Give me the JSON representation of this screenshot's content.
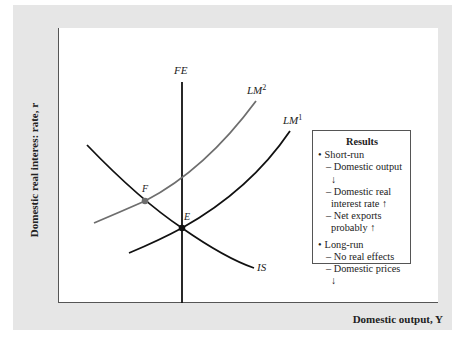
{
  "axes": {
    "y_label": "Domestic real interes: rate, r",
    "x_label": "Domestic output, Y"
  },
  "curves": {
    "FE": "FE",
    "LM2": "LM",
    "LM2_sup": "2",
    "LM1": "LM",
    "LM1_sup": "1",
    "IS": "IS"
  },
  "points": {
    "E": "E",
    "F": "F"
  },
  "legend": {
    "title": "Results",
    "short_run": "Short-run",
    "short_items": [
      "– Domestic output ↓",
      "– Domestic real interest rate ↑",
      "– Net exports probably ↑"
    ],
    "long_run": "Long-run",
    "long_items": [
      "– No real effects",
      "– Domestic prices ↓"
    ]
  },
  "colors": {
    "frame_bg": "#e6e6e6",
    "curve_black": "#111111",
    "curve_gray": "#6e6e6e"
  }
}
